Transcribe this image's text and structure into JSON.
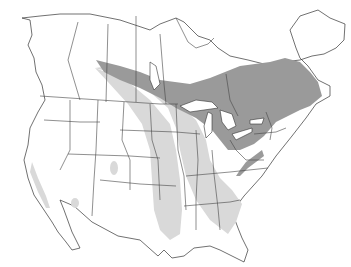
{
  "map": {
    "region": "North America",
    "type": "species range map",
    "colors": {
      "background": "#ffffff",
      "land": "#ffffff",
      "borders": "#333333",
      "range_primary": "#9a9a9a",
      "range_secondary": "#d9d9d9"
    },
    "legend": []
  }
}
